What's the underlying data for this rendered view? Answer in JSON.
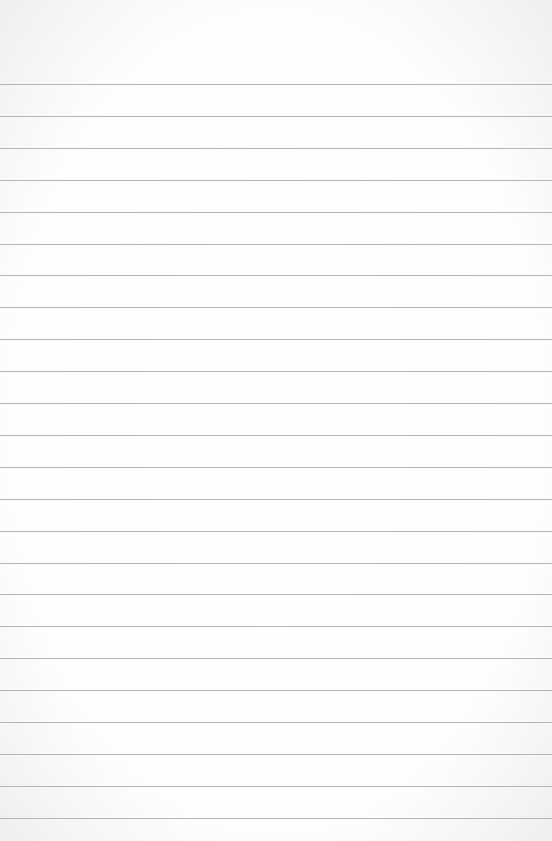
{
  "page": {
    "paper_color": "#ffffff",
    "rule_color": "#a9a9a9",
    "rule_count": 24
  }
}
